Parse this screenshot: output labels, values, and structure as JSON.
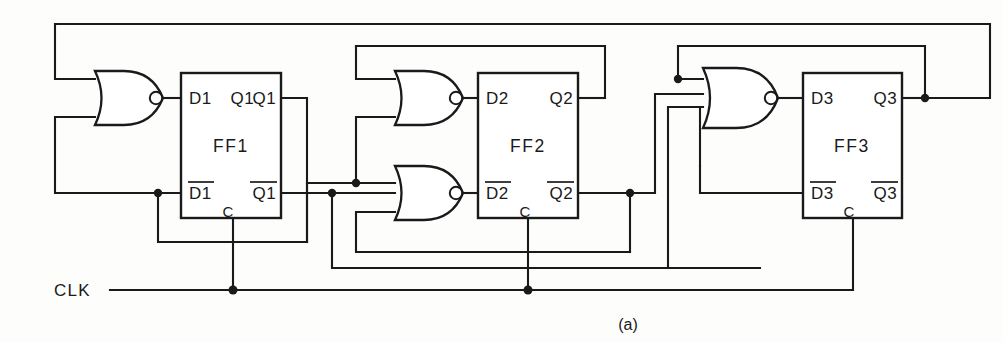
{
  "figure": {
    "caption": "(a)",
    "clock_label": "CLK"
  },
  "colors": {
    "ink": "#1a1a1a",
    "paper": "#fdfdfc",
    "gate_fill": "#ffffff"
  },
  "flipflops": [
    {
      "name": "FF1",
      "d": "D1",
      "dbar": "D1",
      "q": "Q1",
      "qbar": "Q1",
      "clock_pin": "C"
    },
    {
      "name": "FF2",
      "d": "D2",
      "dbar": "D2",
      "q": "Q2",
      "qbar": "Q2",
      "clock_pin": "C"
    },
    {
      "name": "FF3",
      "d": "D3",
      "dbar": "D3",
      "q": "Q3",
      "qbar": "Q3",
      "clock_pin": "C"
    }
  ],
  "gates": [
    {
      "id": "nor1",
      "type": "NOR",
      "inputs": 2,
      "drives": "D1"
    },
    {
      "id": "nor2a",
      "type": "NOR",
      "inputs": 2,
      "drives": "D2"
    },
    {
      "id": "nor2b",
      "type": "NOR",
      "inputs": 2,
      "drives": "D2bar"
    },
    {
      "id": "nor3",
      "type": "NOR",
      "inputs": 3,
      "drives": "D3"
    }
  ],
  "signals": {
    "clock": "CLK"
  }
}
